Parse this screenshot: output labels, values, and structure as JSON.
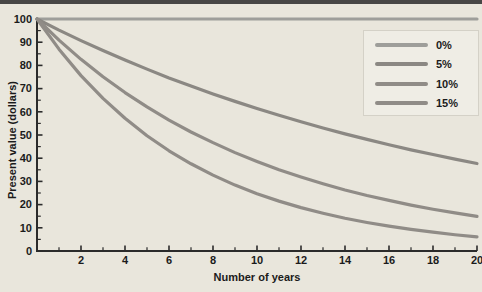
{
  "figure": {
    "background": "#e9e6dc",
    "top_rule_color": "#474645",
    "axis_color": "#2b2b2b",
    "text_color": "#1b1b1b"
  },
  "chart_data": {
    "type": "line",
    "title": "",
    "xlabel": "Number of years",
    "ylabel": "Present value (dollars)",
    "xlim": [
      0,
      20
    ],
    "ylim": [
      0,
      100
    ],
    "grid": false,
    "legend_position": "upper right",
    "x_major_ticks": [
      2,
      4,
      6,
      8,
      10,
      12,
      14,
      16,
      18,
      20
    ],
    "x_minor_ticks": [
      1,
      3,
      5,
      7,
      9,
      11,
      13,
      15,
      17,
      19
    ],
    "y_major_ticks": [
      0,
      10,
      20,
      30,
      40,
      50,
      60,
      70,
      80,
      90,
      100
    ],
    "y_minor_ticks": [
      5,
      15,
      25,
      35,
      45,
      55,
      65,
      75,
      85,
      95
    ],
    "x": [
      0,
      1,
      2,
      3,
      4,
      5,
      6,
      7,
      8,
      9,
      10,
      11,
      12,
      13,
      14,
      15,
      16,
      17,
      18,
      19,
      20
    ],
    "series": [
      {
        "name": "0%",
        "color": "#9e9e9a",
        "values": [
          100,
          100,
          100,
          100,
          100,
          100,
          100,
          100,
          100,
          100,
          100,
          100,
          100,
          100,
          100,
          100,
          100,
          100,
          100,
          100,
          100
        ]
      },
      {
        "name": "5%",
        "color": "#8b8883",
        "values": [
          100,
          95.2,
          90.7,
          86.4,
          82.3,
          78.4,
          74.6,
          71.1,
          67.7,
          64.5,
          61.4,
          58.5,
          55.7,
          53.0,
          50.5,
          48.1,
          45.8,
          43.6,
          41.6,
          39.6,
          37.7
        ]
      },
      {
        "name": "10%",
        "color": "#908c87",
        "values": [
          100,
          90.9,
          82.6,
          75.1,
          68.3,
          62.1,
          56.4,
          51.3,
          46.7,
          42.4,
          38.6,
          35.0,
          31.9,
          29.0,
          26.3,
          23.9,
          21.8,
          19.8,
          18.0,
          16.4,
          14.9
        ]
      },
      {
        "name": "15%",
        "color": "#908c87",
        "values": [
          100,
          87.0,
          75.6,
          65.8,
          57.2,
          49.7,
          43.2,
          37.6,
          32.7,
          28.4,
          24.7,
          21.5,
          18.7,
          16.3,
          14.1,
          12.3,
          10.7,
          9.3,
          8.1,
          7.0,
          6.1
        ]
      }
    ]
  }
}
